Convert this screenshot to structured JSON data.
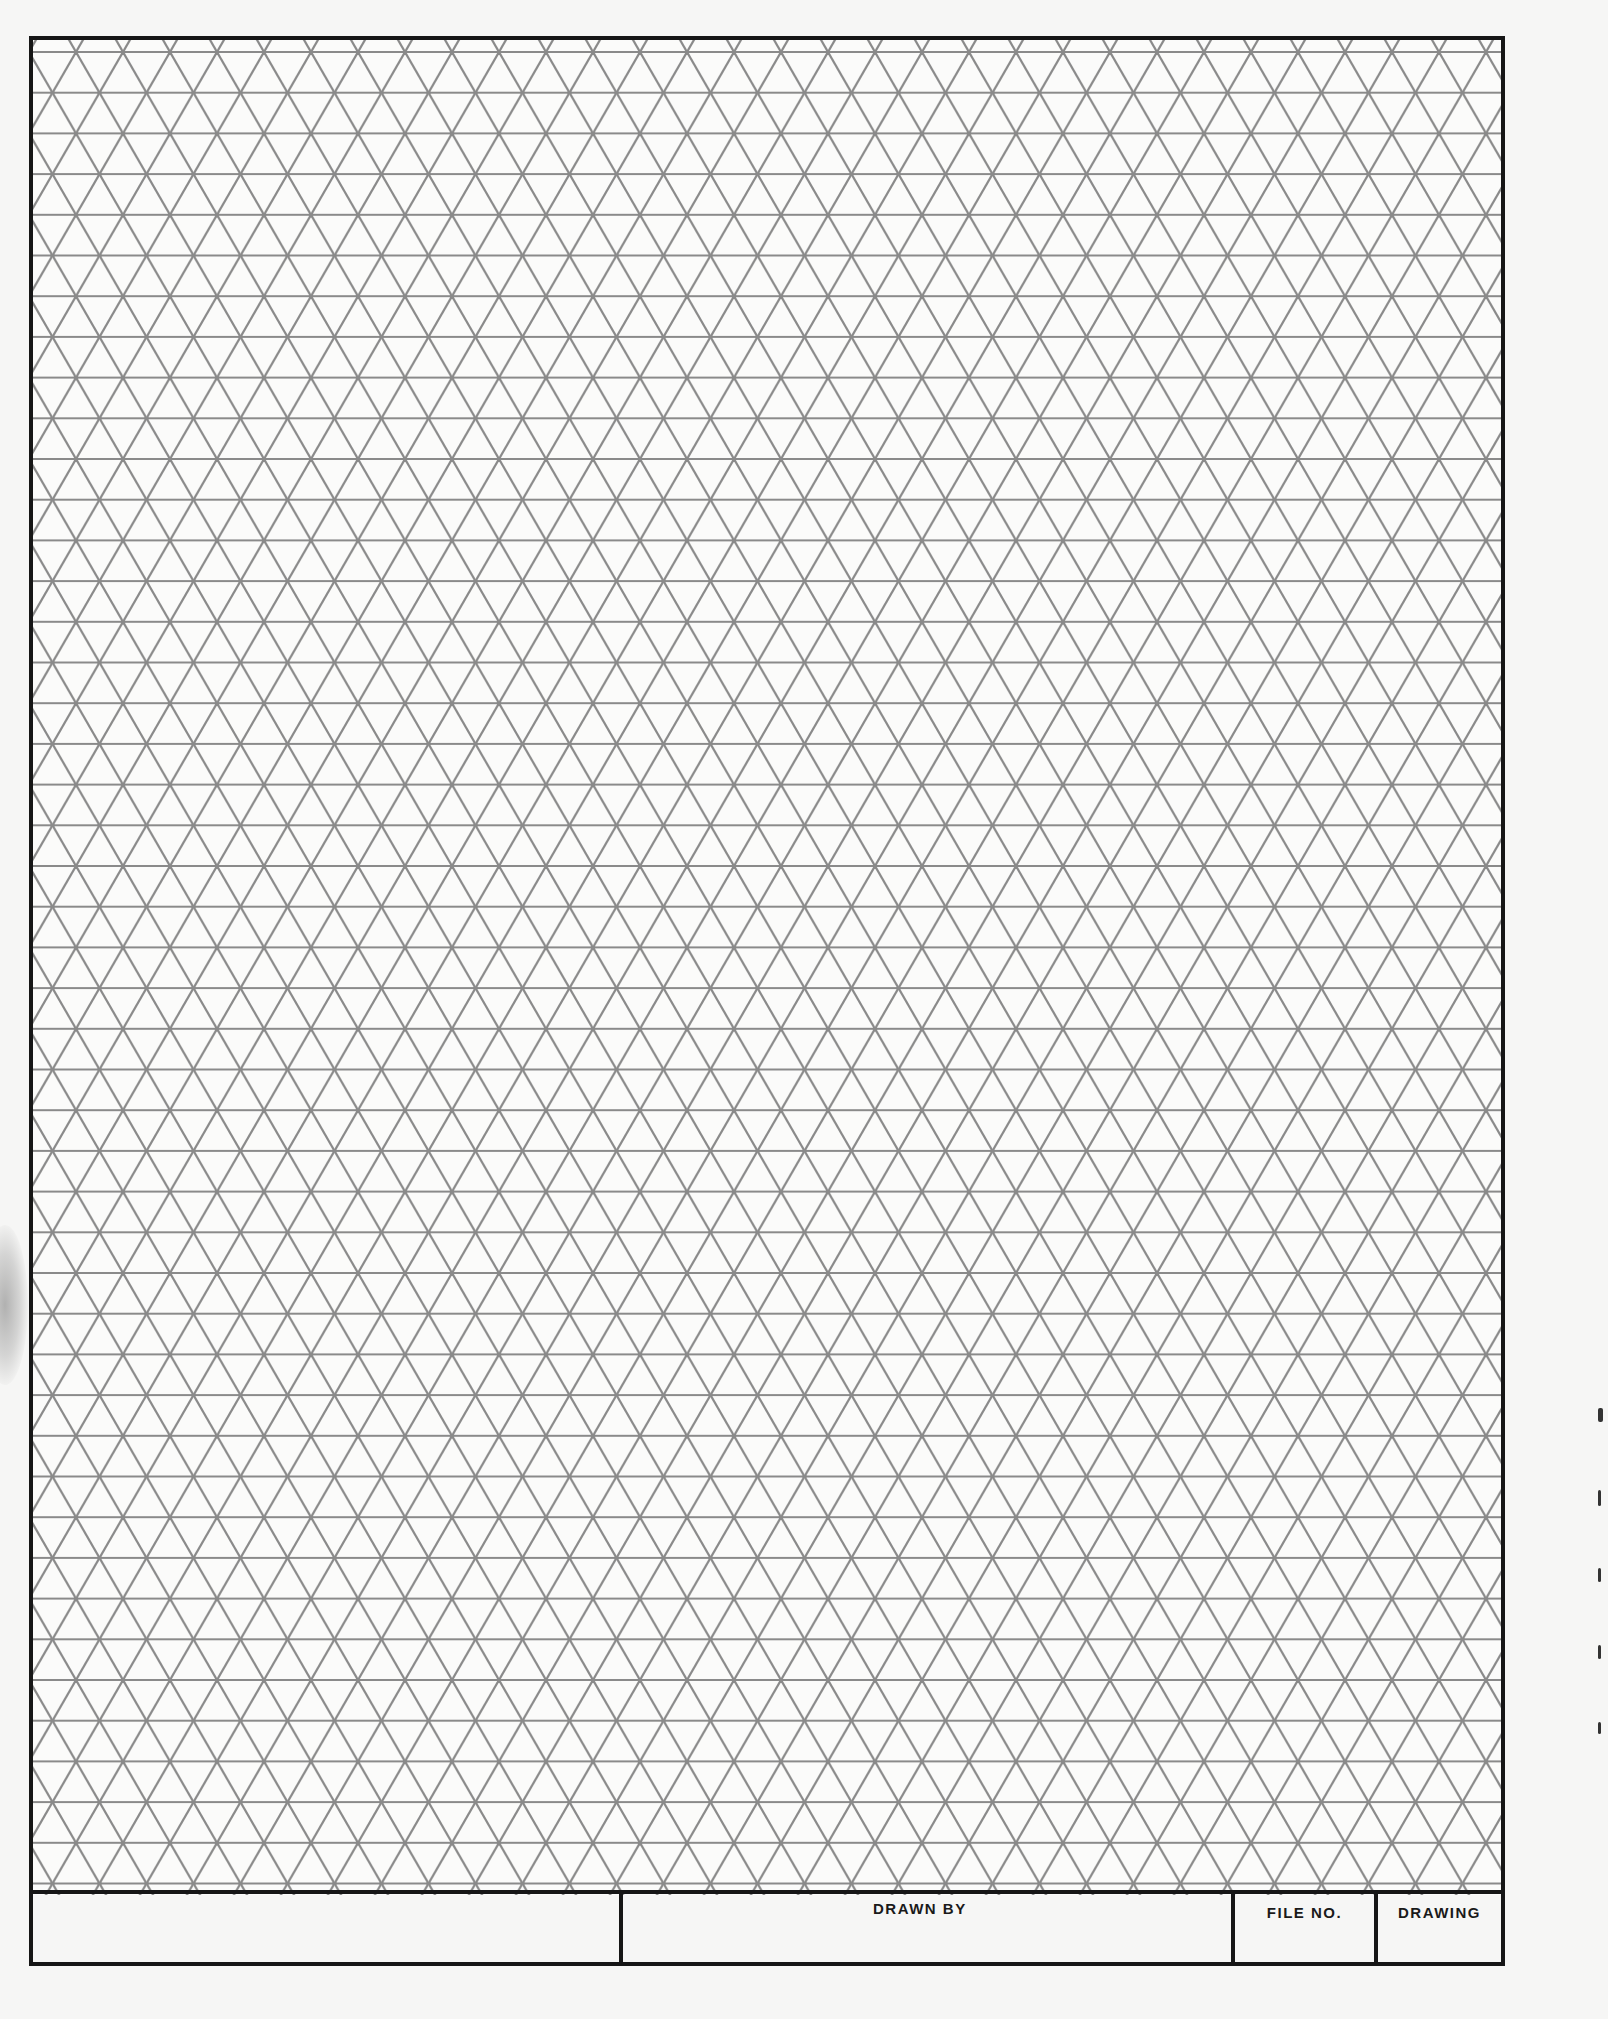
{
  "document": {
    "type": "isometric-grid-drawing-sheet",
    "grid": {
      "pattern": "equilateral-triangle",
      "row_height_px": 40.7,
      "triangle_base_px": 47,
      "line_color": "#8a8a8a",
      "border_color": "#161616"
    },
    "title_block": {
      "cells": [
        {
          "label": ""
        },
        {
          "label": "DRAWN BY"
        },
        {
          "label": "FILE NO."
        },
        {
          "label": "DRAWING"
        }
      ]
    }
  }
}
